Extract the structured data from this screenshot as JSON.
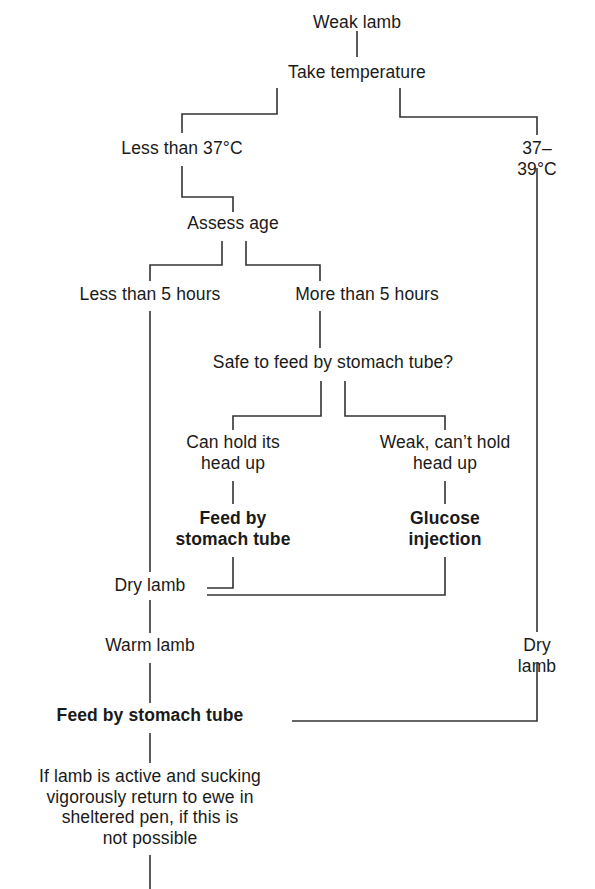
{
  "diagram": {
    "type": "flowchart",
    "line_color": "#333333",
    "text_color": "#1a1a1a",
    "background": "#ffffff",
    "nodes": [
      {
        "id": "weak-lamb",
        "label": "Weak lamb",
        "bold": false
      },
      {
        "id": "take-temperature",
        "label": "Take temperature",
        "bold": false
      },
      {
        "id": "less-than-37c",
        "label": "Less than 37°C",
        "bold": false
      },
      {
        "id": "37-39c",
        "label": "37–39°C",
        "bold": false
      },
      {
        "id": "assess-age",
        "label": "Assess age",
        "bold": false
      },
      {
        "id": "less-than-5-hours",
        "label": "Less than 5 hours",
        "bold": false
      },
      {
        "id": "more-than-5-hours",
        "label": "More than 5 hours",
        "bold": false
      },
      {
        "id": "safe-to-feed",
        "label": "Safe to feed by stomach tube?",
        "bold": false
      },
      {
        "id": "can-hold-head-up",
        "label": "Can hold its\nhead up",
        "bold": false
      },
      {
        "id": "weak-cant-hold-head",
        "label": "Weak, can’t hold\nhead up",
        "bold": false
      },
      {
        "id": "feed-by-stomach-tube-1",
        "label": "Feed by\nstomach tube",
        "bold": true
      },
      {
        "id": "glucose-injection",
        "label": "Glucose\ninjection",
        "bold": true
      },
      {
        "id": "dry-lamb-left",
        "label": "Dry lamb",
        "bold": false
      },
      {
        "id": "dry-lamb-right",
        "label": "Dry lamb",
        "bold": false
      },
      {
        "id": "warm-lamb",
        "label": "Warm lamb",
        "bold": false
      },
      {
        "id": "feed-by-stomach-tube-2",
        "label": "Feed by stomach tube",
        "bold": true
      },
      {
        "id": "if-lamb-is-active",
        "label": "If lamb is active and sucking\nvigorously return to ewe in\nsheltered pen, if this is\nnot possible",
        "bold": false
      }
    ]
  }
}
